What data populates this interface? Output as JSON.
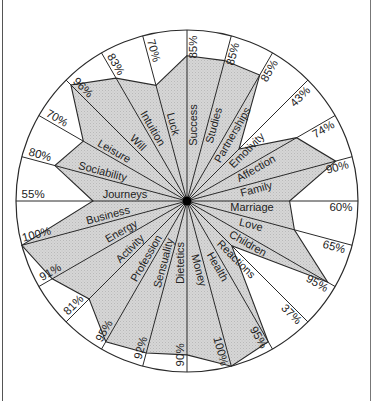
{
  "chart_data": {
    "type": "radar",
    "title": "",
    "value_unit": "%",
    "range": [
      0,
      100
    ],
    "direction": "clockwise from top, 15 degrees per axis",
    "categories": [
      "Success",
      "Studies",
      "Partnerships",
      "Emotivity",
      "Affection",
      "Family",
      "Marriage",
      "Love",
      "Children",
      "Reactions",
      "Health",
      "Money",
      "Dietetics",
      "Sensuality",
      "Profession",
      "Activity",
      "Energy",
      "Business",
      "Journeys",
      "Sociability",
      "Leisure",
      "Will",
      "Intuition",
      "Luck"
    ],
    "values": [
      85,
      85,
      85,
      43,
      74,
      90,
      60,
      65,
      95,
      37,
      95,
      100,
      90,
      92,
      95,
      81,
      91,
      100,
      55,
      80,
      70,
      96,
      83,
      70
    ],
    "value_labels": [
      "85%",
      "85%",
      "85%",
      "43%",
      "74%",
      "90%",
      "60%",
      "65%",
      "95%",
      "37%",
      "95%",
      "100%",
      "90%",
      "92%",
      "95%",
      "81%",
      "91%",
      "100%",
      "55%",
      "80%",
      "70%",
      "96%",
      "83%",
      "70%"
    ],
    "fill_color": "#d0d0d0",
    "line_color": "#2a2a2a",
    "grid": "radial spokes with outer circle"
  },
  "layout": {
    "cx": 187,
    "cy": 201,
    "r": 171,
    "label_radius": [
      76,
      80,
      80,
      78,
      76,
      70,
      65,
      68,
      74,
      76,
      72,
      70,
      62,
      66,
      70,
      74,
      72,
      80,
      62,
      89,
      88,
      76,
      80,
      78
    ],
    "pct_radius": 0.9
  }
}
